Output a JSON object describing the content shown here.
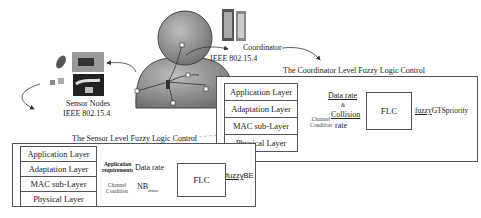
{
  "coordinator": {
    "label": "Coordinator",
    "standard": "IEEE 802.15.4"
  },
  "sensor_nodes": {
    "label": "Sensor Nodes",
    "standard": "IEEE 802.15.4"
  },
  "coordinator_flc": {
    "title": "The Coordinator Level Fuzzy Logic Control",
    "layers": [
      "Application Layer",
      "Adaptation Layer",
      "MAC sub-Layer",
      "Physical Layer"
    ],
    "inputs": [
      "Data rate",
      "&",
      "Collision",
      "rate"
    ],
    "side_note": [
      "Channel",
      "Condition"
    ],
    "flc_label": "FLC",
    "output_prefix": "fuzzy",
    "output_suffix": "GTSpriority"
  },
  "sensor_flc": {
    "title": "The Sensor Level Fuzzy Logic Control",
    "layers": [
      "Application Layer",
      "Adaptation Layer",
      "MAC sub-Layer",
      "Physical Layer"
    ],
    "app_req": [
      "Application",
      "requirements"
    ],
    "channel": [
      "Channel",
      "Condition"
    ],
    "input_1": "Data rate",
    "input_2_main": "NB",
    "input_2_sub": "trans",
    "flc_label": "FLC",
    "output_prefix": "fuzzy",
    "output_suffix": "BE"
  },
  "colors": {
    "line": "#555555",
    "body": "#8a8a8a",
    "dashed": "#aaaaaa"
  }
}
